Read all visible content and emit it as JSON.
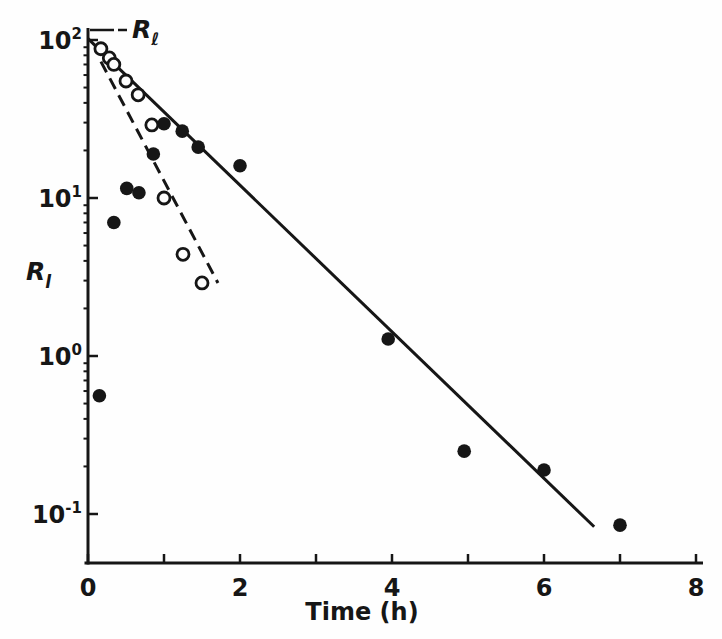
{
  "figure": {
    "background": "#fefefe",
    "ink_color": "#161616"
  },
  "chart_data": {
    "type": "scatter",
    "title": "",
    "xlabel": "Time (h)",
    "ylabel": {
      "base": "R",
      "sub": "l"
    },
    "x_axis": {
      "min": 0,
      "max": 8,
      "ticks": [
        0,
        1,
        2,
        3,
        4,
        5,
        6,
        7,
        8
      ],
      "labeled_ticks": [
        0,
        2,
        4,
        6,
        8
      ]
    },
    "y_axis": {
      "scale": "log",
      "min": 0.1,
      "max": 100,
      "ticks": [
        {
          "base": "10",
          "exp": "2",
          "value": 100
        },
        {
          "base": "10",
          "exp": "1",
          "value": 10
        },
        {
          "base": "10",
          "exp": "0",
          "value": 1
        },
        {
          "base": "10",
          "exp": "-1",
          "value": 0.1
        }
      ],
      "minor_ticks": "log sub-decades 2-9"
    },
    "series": [
      {
        "name": "filled-circles",
        "marker": "filled-circle",
        "points": [
          {
            "t": 0.15,
            "r": 0.56
          },
          {
            "t": 0.34,
            "r": 7.0
          },
          {
            "t": 0.51,
            "r": 11.5
          },
          {
            "t": 0.67,
            "r": 10.8
          },
          {
            "t": 0.86,
            "r": 19.0
          },
          {
            "t": 1.0,
            "r": 29.5
          },
          {
            "t": 1.24,
            "r": 26.5
          },
          {
            "t": 1.45,
            "r": 21.0
          },
          {
            "t": 2.0,
            "r": 16.0
          },
          {
            "t": 3.95,
            "r": 1.28
          },
          {
            "t": 4.95,
            "r": 0.25
          },
          {
            "t": 6.0,
            "r": 0.19
          },
          {
            "t": 7.0,
            "r": 0.085
          }
        ]
      },
      {
        "name": "open-circles",
        "marker": "open-circle",
        "points": [
          {
            "t": 0.17,
            "r": 88
          },
          {
            "t": 0.28,
            "r": 77
          },
          {
            "t": 0.34,
            "r": 70
          },
          {
            "t": 0.5,
            "r": 55
          },
          {
            "t": 0.66,
            "r": 45
          },
          {
            "t": 0.84,
            "r": 29
          },
          {
            "t": 1.0,
            "r": 10
          },
          {
            "t": 1.25,
            "r": 4.4
          },
          {
            "t": 1.5,
            "r": 2.9
          }
        ]
      }
    ],
    "lines": [
      {
        "name": "solid-fit-line",
        "style": "solid",
        "from": {
          "t": 0.0,
          "r": 102
        },
        "to": {
          "t": 6.66,
          "r": 0.083
        }
      },
      {
        "name": "dashed-fit-line",
        "style": "dashed",
        "from": {
          "t": 0.17,
          "r": 73
        },
        "to": {
          "t": 1.71,
          "r": 2.9
        }
      }
    ],
    "annotation": {
      "base": "R",
      "sub": "ℓ"
    },
    "legend": "none",
    "grid": "off"
  }
}
